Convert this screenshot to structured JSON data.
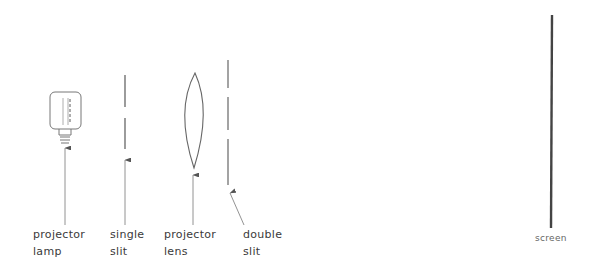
{
  "diagram": {
    "title": "",
    "components": [
      {
        "id": "lamp",
        "label_lines": [
          "projector",
          "lamp"
        ]
      },
      {
        "id": "single-slit",
        "label_lines": [
          "single",
          "slit"
        ]
      },
      {
        "id": "lens",
        "label_lines": [
          "projector",
          "lens"
        ]
      },
      {
        "id": "double-slit",
        "label_lines": [
          "double",
          "slit"
        ]
      },
      {
        "id": "screen",
        "label_lines": [
          "screen"
        ]
      }
    ],
    "colors": {
      "ink": "#555555",
      "screen": "#444444",
      "text": "#3a3a3a"
    }
  }
}
